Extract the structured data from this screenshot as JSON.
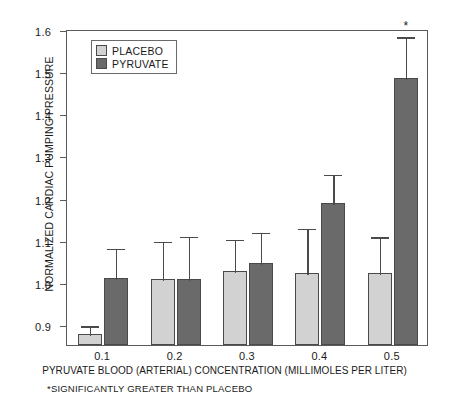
{
  "chart_data": {
    "type": "bar",
    "title": "",
    "xlabel": "PYRUVATE BLOOD (ARTERIAL) CONCENTRATION (MILLIMOLES PER LITER)",
    "ylabel": "NORMALIZED CARDIAC PUMPING PRESSURE",
    "categories": [
      "0.1",
      "0.2",
      "0.3",
      "0.4",
      "0.5"
    ],
    "ylim": [
      0.85,
      1.6
    ],
    "yticks": [
      "0.9",
      "1.0",
      "1.1",
      "1.2",
      "1.3",
      "1.4",
      "1.5",
      "1.6"
    ],
    "ytick_values": [
      0.9,
      1.0,
      1.1,
      1.2,
      1.3,
      1.4,
      1.5,
      1.6
    ],
    "grid": false,
    "legend_position": "upper-left",
    "series": [
      {
        "name": "PLACEBO",
        "color": "#d2d2d2",
        "values": [
          0.875,
          1.007,
          1.025,
          1.021,
          1.022
        ],
        "errors_upper": [
          0.899,
          1.099,
          1.105,
          1.13,
          1.11
        ]
      },
      {
        "name": "PYRUVATE",
        "color": "#6a6a6a",
        "values": [
          1.008,
          1.006,
          1.044,
          1.188,
          1.483
        ],
        "errors_upper": [
          1.082,
          1.111,
          1.121,
          1.258,
          1.585
        ]
      }
    ],
    "annotations": [
      {
        "text": "*",
        "category": "0.5",
        "series": "PYRUVATE",
        "y": 1.6
      }
    ],
    "footnote": "*SIGNIFICANTLY GREATER THAN PLACEBO"
  },
  "legend": {
    "items": [
      {
        "label": "PLACEBO",
        "color": "#d2d2d2"
      },
      {
        "label": "PYRUVATE",
        "color": "#6a6a6a"
      }
    ]
  }
}
